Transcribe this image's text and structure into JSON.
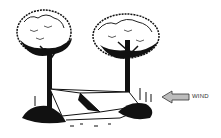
{
  "illustration": {
    "subject": "tarp shelter tied between two trees",
    "wind_label": "WIND",
    "wind_arrow_direction": "left",
    "colors": {
      "ink": "#111111",
      "arrow_fill": "#bdbdbd",
      "background": "#ffffff"
    }
  }
}
